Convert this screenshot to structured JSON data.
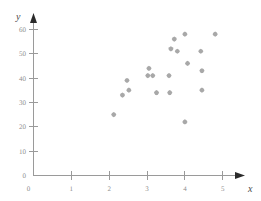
{
  "chart_data": {
    "type": "scatter",
    "title": "",
    "subtitle": "",
    "xlabel": "x",
    "ylabel": "y",
    "xlim": [
      0,
      5.35
    ],
    "ylim": [
      0,
      63
    ],
    "xticks": [
      0,
      1,
      2,
      3,
      4,
      5
    ],
    "xtick_labels": [
      "0",
      "1",
      "2",
      "3",
      "4",
      "5"
    ],
    "yticks": [
      0,
      10,
      20,
      30,
      40,
      50,
      60
    ],
    "ytick_labels": [
      "0",
      "10",
      "20",
      "30",
      "40",
      "50",
      "60"
    ],
    "grid": false,
    "legend": null,
    "marker": "diamond",
    "marker_color": "#a8a8a8",
    "axis_color": "#9a9a9a",
    "points": [
      {
        "x": 2.12,
        "y": 25
      },
      {
        "x": 2.35,
        "y": 33
      },
      {
        "x": 2.47,
        "y": 39
      },
      {
        "x": 2.52,
        "y": 35
      },
      {
        "x": 3.02,
        "y": 41
      },
      {
        "x": 3.05,
        "y": 44
      },
      {
        "x": 3.15,
        "y": 41
      },
      {
        "x": 3.25,
        "y": 34
      },
      {
        "x": 3.58,
        "y": 41
      },
      {
        "x": 3.6,
        "y": 34
      },
      {
        "x": 3.63,
        "y": 52
      },
      {
        "x": 3.72,
        "y": 56
      },
      {
        "x": 3.8,
        "y": 51
      },
      {
        "x": 4.0,
        "y": 58
      },
      {
        "x": 4.0,
        "y": 22
      },
      {
        "x": 4.07,
        "y": 46
      },
      {
        "x": 4.42,
        "y": 51
      },
      {
        "x": 4.45,
        "y": 43
      },
      {
        "x": 4.45,
        "y": 35
      },
      {
        "x": 4.8,
        "y": 58
      }
    ]
  },
  "axes": {
    "x_axis_name": "x",
    "y_axis_name": "y"
  }
}
